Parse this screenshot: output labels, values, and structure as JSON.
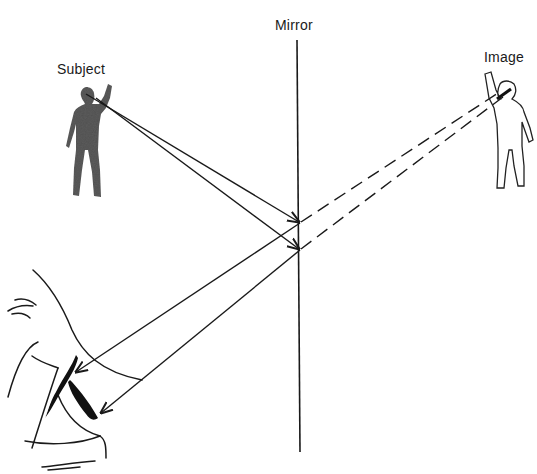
{
  "diagram": {
    "labels": {
      "mirror": "Mirror",
      "subject": "Subject",
      "image": "Image"
    },
    "elements": {
      "mirror": {
        "type": "vertical-line",
        "x_top": 297,
        "y_top": 40,
        "x_bottom": 300,
        "y_bottom": 452
      },
      "subject_figure": {
        "style": "filled",
        "color": "#555555",
        "eye_point": [
          86,
          94
        ]
      },
      "image_figure": {
        "style": "outline",
        "color": "#222222",
        "eye_point": [
          502,
          92
        ]
      },
      "observer_eye": {
        "position": "bottom-left"
      }
    },
    "rays": {
      "incident": [
        {
          "from": [
            86,
            94
          ],
          "to": [
            300,
            223
          ]
        },
        {
          "from": [
            98,
            96
          ],
          "to": [
            300,
            250
          ]
        }
      ],
      "reflected": [
        {
          "from": [
            300,
            223
          ],
          "to": [
            75,
            372
          ]
        },
        {
          "from": [
            300,
            250
          ],
          "to": [
            100,
            414
          ]
        }
      ],
      "virtual": [
        {
          "from": [
            300,
            223
          ],
          "to": [
            500,
            92
          ],
          "style": "dashed"
        },
        {
          "from": [
            300,
            250
          ],
          "to": [
            506,
            97
          ],
          "style": "dashed"
        }
      ]
    },
    "colors": {
      "line": "#1a1a1a",
      "subject_fill": "#5a5a5a",
      "background": "#ffffff"
    }
  }
}
